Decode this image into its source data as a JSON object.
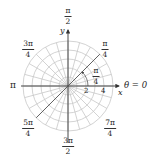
{
  "diagram": {
    "type": "polar-coordinate-grid",
    "center_px": [
      68,
      86
    ],
    "unit_px": 9,
    "circle_radii": [
      1,
      2,
      3,
      4,
      5
    ],
    "radial_line_step_deg": 15,
    "colors": {
      "grid": "#c8c8c8",
      "axis": "#333333",
      "highlight_ray": "#555555",
      "text": "#222222"
    },
    "axes": {
      "x_label": "x",
      "y_label": "y",
      "polar_axis_label": "θ = 0"
    },
    "radius_ticks": [
      {
        "value": 2,
        "label": "2"
      },
      {
        "value": 4,
        "label": "4"
      }
    ],
    "angle_labels": [
      {
        "id": "pi_over_2",
        "num": "π",
        "den": "2"
      },
      {
        "id": "three_pi_over_4",
        "num": "3π",
        "den": "4"
      },
      {
        "id": "pi_over_4_outer",
        "num": "π",
        "den": "4"
      },
      {
        "id": "pi",
        "text": "π"
      },
      {
        "id": "five_pi_over_4",
        "num": "5π",
        "den": "4"
      },
      {
        "id": "seven_pi_over_4",
        "num": "7π",
        "den": "4"
      },
      {
        "id": "three_pi_over_2",
        "num": "3π",
        "den": "2"
      }
    ],
    "highlighted_angle": {
      "num": "π",
      "den": "4",
      "from_deg": 0,
      "to_deg": 45
    }
  }
}
